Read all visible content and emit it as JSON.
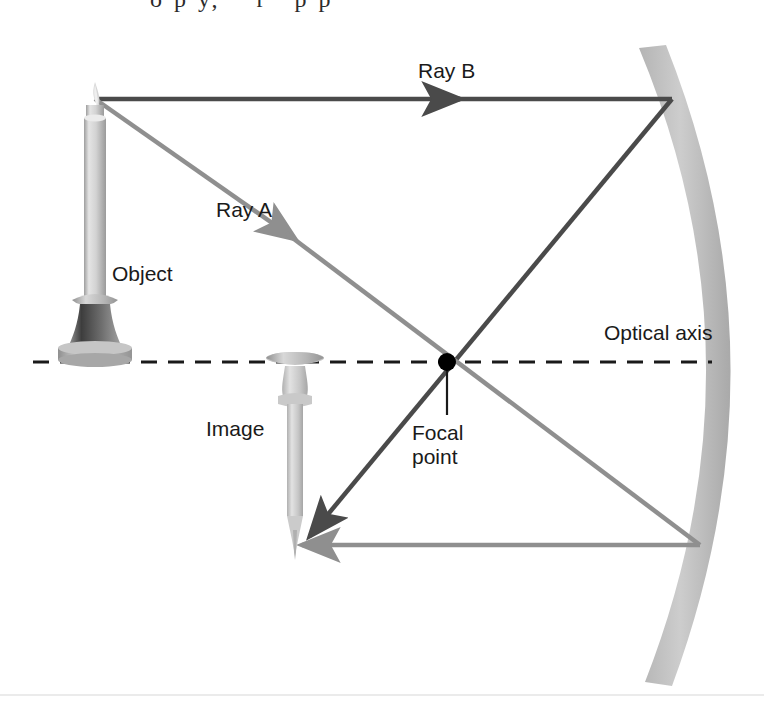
{
  "figure": {
    "title_fragment": "o p y,    r   p p",
    "labels": {
      "ray_b": "Ray B",
      "ray_a": "Ray A",
      "object": "Object",
      "image": "Image",
      "optical_axis": "Optical axis",
      "focal_point_line1": "Focal",
      "focal_point_line2": "point"
    },
    "colors": {
      "ray_b": "#4a4a4a",
      "ray_a": "#8f8f8f",
      "mirror_light": "#c9c9c9",
      "mirror_dark": "#a8a8a8",
      "axis": "#1a1a1a",
      "focal_dot": "#000000",
      "label_text": "#1a1a1a",
      "candle_body": "#cfcfcf",
      "candle_shadow": "#8c8c8c",
      "holder_dark": "#4f4f4f",
      "background": "#ffffff"
    },
    "geometry": {
      "optical_axis_y": 362,
      "optical_axis_x_start": 33,
      "optical_axis_x_end": 712,
      "focal_point": [
        447,
        362
      ],
      "object_tip": [
        95,
        98
      ],
      "image_tip": [
        297,
        545
      ],
      "mirror_vertex": [
        712,
        362
      ],
      "ray_b_mirror_hit": [
        672,
        100
      ],
      "ray_a_mirror_hit": [
        700,
        545
      ]
    },
    "elements": {
      "mirror": "concave-mirror-arc",
      "object_icon": "upright-candle",
      "image_icon": "inverted-candle",
      "focal_marker": "black-dot"
    }
  }
}
